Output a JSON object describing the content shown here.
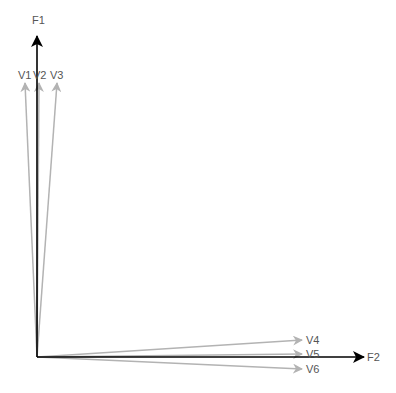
{
  "diagram": {
    "origin": {
      "x": 37,
      "y": 357
    },
    "axes": [
      {
        "id": "F1",
        "label": "F1",
        "tip": {
          "x": 37,
          "y": 36
        },
        "color": "#000000",
        "label_pos": {
          "x": 32,
          "y": 15
        }
      },
      {
        "id": "F2",
        "label": "F2",
        "tip": {
          "x": 364,
          "y": 357
        },
        "color": "#000000",
        "label_pos": {
          "x": 367,
          "y": 352
        }
      }
    ],
    "vectors": [
      {
        "id": "V1",
        "label": "V1",
        "tip": {
          "x": 25,
          "y": 83
        },
        "color": "#b3b3b3",
        "label_pos": {
          "x": 18,
          "y": 70
        }
      },
      {
        "id": "V2",
        "label": "V2",
        "tip": {
          "x": 39,
          "y": 83
        },
        "color": "#b3b3b3",
        "label_pos": {
          "x": 33,
          "y": 70
        }
      },
      {
        "id": "V3",
        "label": "V3",
        "tip": {
          "x": 57,
          "y": 83
        },
        "color": "#b3b3b3",
        "label_pos": {
          "x": 50,
          "y": 70
        }
      },
      {
        "id": "V4",
        "label": "V4",
        "tip": {
          "x": 302,
          "y": 340
        },
        "color": "#b3b3b3",
        "label_pos": {
          "x": 306,
          "y": 335
        }
      },
      {
        "id": "V5",
        "label": "V5",
        "tip": {
          "x": 302,
          "y": 354
        },
        "color": "#b3b3b3",
        "label_pos": {
          "x": 306,
          "y": 349
        }
      },
      {
        "id": "V6",
        "label": "V6",
        "tip": {
          "x": 302,
          "y": 369
        },
        "color": "#b3b3b3",
        "label_pos": {
          "x": 306,
          "y": 364
        }
      }
    ]
  }
}
